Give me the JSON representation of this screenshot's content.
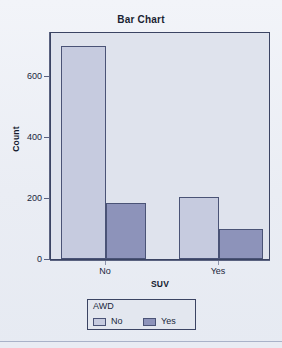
{
  "chart_data": {
    "type": "bar",
    "title": "Bar Chart",
    "xlabel": "SUV",
    "ylabel": "Count",
    "categories": [
      "No",
      "Yes"
    ],
    "series": [
      {
        "name": "No",
        "values": [
          700,
          203
        ]
      },
      {
        "name": "Yes",
        "values": [
          184,
          98
        ]
      }
    ],
    "legend": {
      "title": "AWD",
      "position": "bottom",
      "entries": [
        {
          "label": "No",
          "color": "#c6cbdf"
        },
        {
          "label": "Yes",
          "color": "#8d93ba"
        }
      ]
    },
    "yticks": [
      0,
      200,
      400,
      600
    ],
    "ytick_labels": [
      "0",
      "200",
      "400",
      "600"
    ],
    "ylim": [
      0,
      748
    ],
    "xtick_labels": [
      "No",
      "Yes"
    ],
    "grid": false,
    "bar_style": "grouped",
    "colors": {
      "bar_light": "#c6cbdf",
      "bar_dark": "#8d93ba",
      "bar_outline": "#4a5376",
      "plot_background": "#dfe3ed",
      "page_background": "#eff2f7",
      "axis": "#5a6280",
      "text": "#20273d"
    }
  },
  "axis": {
    "y_tick_0": "0",
    "y_tick_200": "200",
    "y_tick_400": "400",
    "y_tick_600": "600",
    "y_title": "Count",
    "x_tick_no": "No",
    "x_tick_yes": "Yes",
    "x_title": "SUV"
  },
  "legend": {
    "title": "AWD",
    "item_no": "No",
    "item_yes": "Yes"
  },
  "header": {
    "title": "Bar Chart"
  }
}
